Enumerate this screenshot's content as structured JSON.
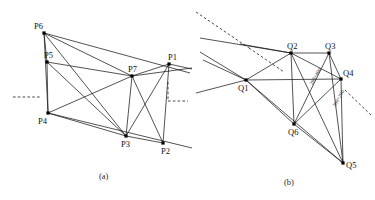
{
  "figure": {
    "width": 375,
    "height": 200,
    "background": "#ffffff",
    "stroke_color": "#1a1a1a",
    "vertex_color": "#000000"
  },
  "panel_a": {
    "caption": "(a)",
    "caption_pos": [
      99,
      172
    ],
    "vertices": [
      {
        "id": "P6",
        "x": 44,
        "y": 33,
        "label_dx": -10,
        "label_dy": -11
      },
      {
        "id": "P5",
        "x": 47,
        "y": 62,
        "label_dx": -3,
        "label_dy": -11
      },
      {
        "id": "P4",
        "x": 48,
        "y": 113,
        "label_dx": -10,
        "label_dy": 4
      },
      {
        "id": "P7",
        "x": 132,
        "y": 76,
        "label_dx": -4,
        "label_dy": -11
      },
      {
        "id": "P1",
        "x": 169,
        "y": 64,
        "label_dx": -1,
        "label_dy": -11
      },
      {
        "id": "P3",
        "x": 126,
        "y": 136,
        "label_dx": -5,
        "label_dy": 4
      },
      {
        "id": "P2",
        "x": 163,
        "y": 143,
        "label_dx": -2,
        "label_dy": 4
      }
    ],
    "edges": [
      [
        "P6",
        "P5"
      ],
      [
        "P5",
        "P4"
      ],
      [
        "P6",
        "P4"
      ],
      [
        "P6",
        "P7"
      ],
      [
        "P5",
        "P7"
      ],
      [
        "P4",
        "P7"
      ],
      [
        "P5",
        "P3"
      ],
      [
        "P4",
        "P3"
      ],
      [
        "P7",
        "P3"
      ],
      [
        "P7",
        "P1"
      ],
      [
        "P7",
        "P2"
      ],
      [
        "P1",
        "P2"
      ],
      [
        "P1",
        "P3"
      ],
      [
        "P3",
        "P2"
      ],
      [
        "P6",
        "P3"
      ]
    ],
    "dashed_segments": [
      {
        "x1": 13,
        "y1": 97,
        "x2": 40,
        "y2": 97
      },
      {
        "x1": 168,
        "y1": 82,
        "x2": 168,
        "y2": 101
      },
      {
        "x1": 168,
        "y1": 101,
        "x2": 188,
        "y2": 101
      }
    ],
    "long_rays": [
      {
        "x1": 44,
        "y1": 33,
        "x2": 190,
        "y2": 73
      },
      {
        "x1": 48,
        "y1": 113,
        "x2": 192,
        "y2": 148
      },
      {
        "x1": 132,
        "y1": 76,
        "x2": 192,
        "y2": 68
      },
      {
        "x1": 169,
        "y1": 64,
        "x2": 192,
        "y2": 69
      }
    ]
  },
  "panel_b": {
    "caption": "(b)",
    "caption_pos": [
      284,
      178
    ],
    "vertices": [
      {
        "id": "Q2",
        "x": 291,
        "y": 53,
        "label_dx": -4,
        "label_dy": -11
      },
      {
        "id": "Q3",
        "x": 329,
        "y": 53,
        "label_dx": -4,
        "label_dy": -11
      },
      {
        "id": "Q1",
        "x": 246,
        "y": 80,
        "label_dx": -8,
        "label_dy": 4
      },
      {
        "id": "Q4",
        "x": 341,
        "y": 79,
        "label_dx": 2,
        "label_dy": -10
      },
      {
        "id": "Q6",
        "x": 294,
        "y": 124,
        "label_dx": -6,
        "label_dy": 4
      },
      {
        "id": "Q5",
        "x": 343,
        "y": 163,
        "label_dx": 3,
        "label_dy": -2
      }
    ],
    "edges": [
      [
        "Q2",
        "Q3"
      ],
      [
        "Q2",
        "Q1"
      ],
      [
        "Q2",
        "Q4"
      ],
      [
        "Q2",
        "Q6"
      ],
      [
        "Q2",
        "Q5"
      ],
      [
        "Q3",
        "Q4"
      ],
      [
        "Q3",
        "Q6"
      ],
      [
        "Q3",
        "Q5"
      ],
      [
        "Q1",
        "Q6"
      ],
      [
        "Q1",
        "Q4"
      ],
      [
        "Q1",
        "Q5"
      ],
      [
        "Q4",
        "Q6"
      ],
      [
        "Q4",
        "Q5"
      ],
      [
        "Q6",
        "Q5"
      ],
      [
        "Q2",
        "Q2"
      ]
    ],
    "annotations": [
      {
        "text": "208+400",
        "x": 311,
        "y": 82,
        "rotate": -60
      },
      {
        "text": "208+200",
        "x": 334,
        "y": 104,
        "rotate": -60
      }
    ],
    "dashed_segments": [
      {
        "x1": 196,
        "y1": 12,
        "x2": 249,
        "y2": 48
      },
      {
        "x1": 249,
        "y1": 48,
        "x2": 284,
        "y2": 72
      },
      {
        "x1": 345,
        "y1": 90,
        "x2": 372,
        "y2": 116
      }
    ],
    "long_rays": [
      {
        "x1": 200,
        "y1": 38,
        "x2": 291,
        "y2": 53
      },
      {
        "x1": 200,
        "y1": 52,
        "x2": 246,
        "y2": 80
      },
      {
        "x1": 203,
        "y1": 60,
        "x2": 246,
        "y2": 80
      },
      {
        "x1": 246,
        "y1": 80,
        "x2": 196,
        "y2": 93
      },
      {
        "x1": 291,
        "y1": 53,
        "x2": 240,
        "y2": 44
      }
    ]
  }
}
